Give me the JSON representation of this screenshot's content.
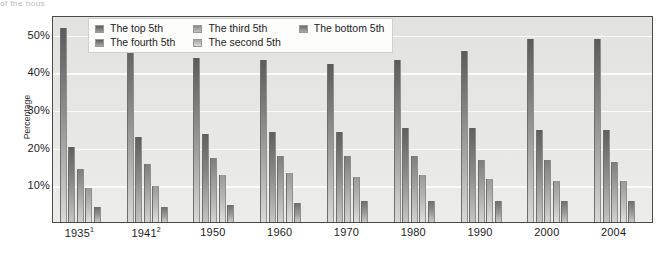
{
  "figure": {
    "title_sliver": "of the hous",
    "background_color": "#ffffff"
  },
  "chart_data": {
    "type": "bar",
    "title": "",
    "subtitle": "",
    "xlabel": "",
    "ylabel": "Percentage",
    "categories": [
      "1935¹",
      "1941²",
      "1950",
      "1960",
      "1970",
      "1980",
      "1990",
      "2000",
      "2004"
    ],
    "category_plain": [
      "1935",
      "1941",
      "1950",
      "1960",
      "1970",
      "1980",
      "1990",
      "2000",
      "2004"
    ],
    "series": [
      {
        "name": "The top 5th",
        "color": "#5b5b5b",
        "values": [
          51.5,
          49.0,
          43.5,
          43.0,
          42.0,
          43.0,
          45.5,
          48.5,
          48.5
        ]
      },
      {
        "name": "The fourth 5th",
        "color": "#5f5f5f",
        "values": [
          20.0,
          22.5,
          23.5,
          24.0,
          24.0,
          25.0,
          25.0,
          24.5,
          24.5
        ]
      },
      {
        "name": "The third 5th",
        "color": "#8a8a88",
        "values": [
          14.0,
          15.5,
          17.0,
          17.5,
          17.5,
          17.5,
          16.5,
          16.5,
          16.0
        ]
      },
      {
        "name": "The second 5th",
        "color": "#a6a6a4",
        "values": [
          9.0,
          9.5,
          12.5,
          13.0,
          12.0,
          12.5,
          11.5,
          11.0,
          11.0
        ]
      },
      {
        "name": "The bottom 5th",
        "color": "#6d6d6b",
        "values": [
          4.0,
          4.0,
          4.5,
          5.0,
          5.5,
          5.5,
          5.5,
          5.5,
          5.5
        ]
      }
    ],
    "ylim": [
      0,
      55
    ],
    "yticks": [
      10,
      20,
      30,
      40,
      50
    ],
    "ytick_labels": [
      "10%",
      "20%",
      "30%",
      "40%",
      "50%"
    ],
    "grid": true,
    "grid_axis": "y",
    "legend_position": "top-inside",
    "legend_layout": "2-rows x 3-columns"
  },
  "legend": {
    "entries": [
      {
        "label": "The top 5th"
      },
      {
        "label": "The fourth 5th"
      },
      {
        "label": "The third 5th"
      },
      {
        "label": "The second 5th"
      },
      {
        "label": "The bottom 5th"
      }
    ]
  }
}
